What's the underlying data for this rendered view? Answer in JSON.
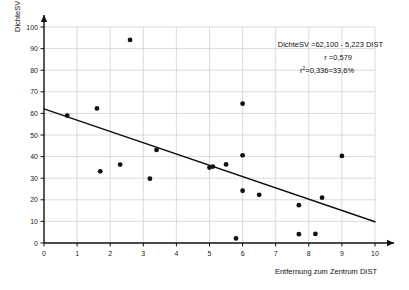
{
  "chart_data": {
    "type": "scatter",
    "title": "",
    "xlabel": "Entfernung zum Zentrum  DIST",
    "ylabel": "DichteSV",
    "xlim": [
      0,
      10
    ],
    "ylim": [
      0,
      100
    ],
    "grid": true,
    "xticks": [
      "0",
      "1",
      "2",
      "3",
      "4",
      "5",
      "6",
      "7",
      "8",
      "9",
      "10"
    ],
    "yticks": [
      "0",
      "10",
      "20",
      "30",
      "40",
      "50",
      "60",
      "70",
      "80",
      "90",
      "100"
    ],
    "point_color": "#111111",
    "line_color": "#111111",
    "grid_color": "#cccccc",
    "axis_color": "#111111",
    "points": [
      {
        "x": 0.7,
        "y": 59.0
      },
      {
        "x": 1.6,
        "y": 62.3
      },
      {
        "x": 1.7,
        "y": 33.2
      },
      {
        "x": 2.3,
        "y": 36.3
      },
      {
        "x": 2.6,
        "y": 94.0
      },
      {
        "x": 3.2,
        "y": 29.8
      },
      {
        "x": 3.4,
        "y": 43.1
      },
      {
        "x": 5.0,
        "y": 34.9
      },
      {
        "x": 5.1,
        "y": 35.4
      },
      {
        "x": 5.5,
        "y": 36.4
      },
      {
        "x": 5.8,
        "y": 2.1
      },
      {
        "x": 6.0,
        "y": 40.6
      },
      {
        "x": 6.0,
        "y": 64.5
      },
      {
        "x": 6.0,
        "y": 24.2
      },
      {
        "x": 6.5,
        "y": 22.3
      },
      {
        "x": 7.7,
        "y": 4.1
      },
      {
        "x": 7.7,
        "y": 17.5
      },
      {
        "x": 8.2,
        "y": 4.2
      },
      {
        "x": 8.4,
        "y": 21.0
      },
      {
        "x": 9.0,
        "y": 40.3
      }
    ],
    "regression": {
      "intercept": 62.1,
      "slope": -5.223,
      "x_start": 0,
      "x_end": 10,
      "y_start": 62.1,
      "y_end": 9.87
    },
    "annotation": {
      "equation": "DichteSV =62,100 - 5,223 DIST",
      "r_line": "r =0,579",
      "r2_base": "r",
      "r2_sup": "2",
      "r2_value": "=0,336=33,6%"
    }
  }
}
